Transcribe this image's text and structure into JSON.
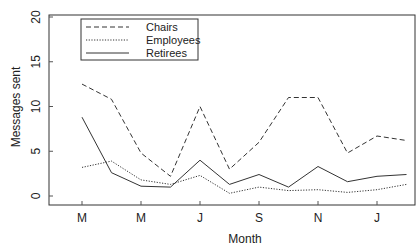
{
  "chart_data": {
    "type": "line",
    "title": "",
    "xlabel": "Month",
    "ylabel": "Messages sent",
    "ylim": [
      0,
      20
    ],
    "yticks": [
      0,
      5,
      10,
      15,
      20
    ],
    "xtick_labels": [
      "M",
      "M",
      "J",
      "S",
      "N",
      "J"
    ],
    "x": [
      "Mar",
      "Apr",
      "May",
      "Jun",
      "Jul",
      "Aug",
      "Sep",
      "Oct",
      "Nov",
      "Dec",
      "Jan",
      "Feb"
    ],
    "grid": false,
    "legend_position": "top-left",
    "series": [
      {
        "name": "Chairs",
        "style": "dashed",
        "values": [
          12.5,
          10.8,
          4.8,
          2.2,
          10.0,
          3.0,
          6.0,
          11.0,
          11.0,
          4.8,
          6.7,
          6.2
        ]
      },
      {
        "name": "Employees",
        "style": "dotted",
        "values": [
          3.2,
          3.9,
          1.8,
          1.3,
          2.3,
          0.3,
          1.0,
          0.6,
          0.7,
          0.4,
          0.7,
          1.3
        ]
      },
      {
        "name": "Retirees",
        "style": "solid",
        "values": [
          8.8,
          2.6,
          1.1,
          1.0,
          4.0,
          1.3,
          2.4,
          1.0,
          3.3,
          1.6,
          2.2,
          2.4
        ]
      }
    ]
  }
}
